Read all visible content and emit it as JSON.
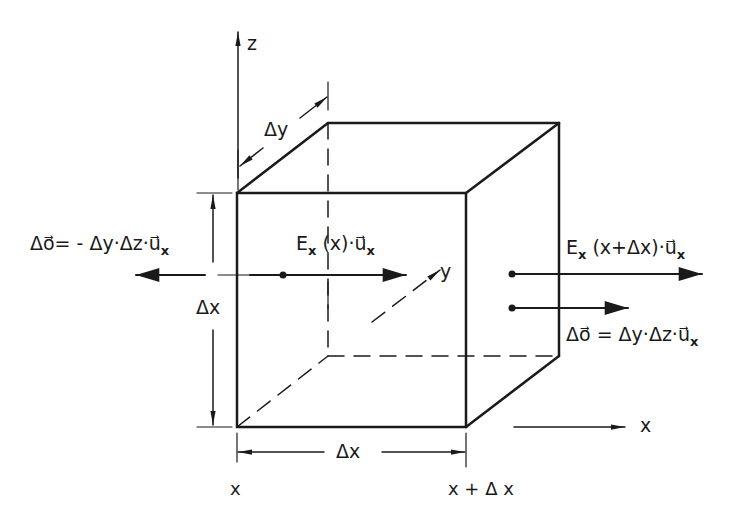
{
  "diagram": {
    "type": "cube-flux-element",
    "colors": {
      "ink": "#1a1a1a",
      "background": "#ffffff"
    },
    "axes": {
      "z": "z",
      "y": "y",
      "x": "x"
    },
    "dimensions": {
      "dy": "Δy",
      "dx_vertical": "Δx",
      "dx_horizontal": "Δx"
    },
    "positions": {
      "left": "x",
      "right": "x + Δ x"
    },
    "labels": {
      "left_area": "Δo⃗= - Δy·Δz·u⃗",
      "left_area_sub": "x",
      "field_in": "E",
      "field_in_sub": "x",
      "field_in_rest": " (x)·u⃗",
      "field_in_sub2": "x",
      "field_out": "E",
      "field_out_sub": "x",
      "field_out_rest": " (x+Δx)·u⃗",
      "field_out_sub2": "x",
      "right_area": "Δo⃗ = Δy·Δz·u⃗",
      "right_area_sub": "x"
    }
  }
}
